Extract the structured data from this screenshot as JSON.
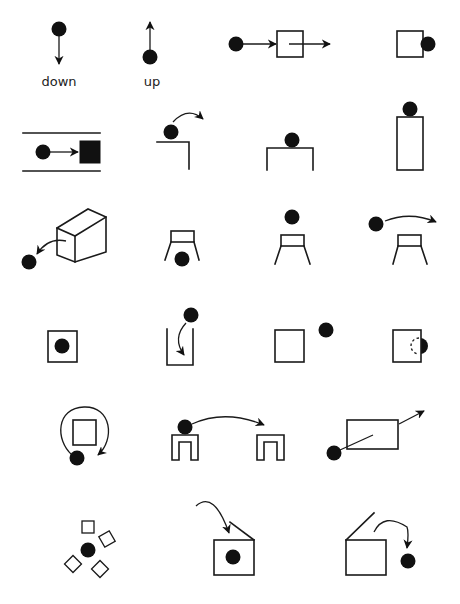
{
  "colors": {
    "ink": "#111111",
    "background": "#ffffff"
  },
  "labels": {
    "down": "down",
    "up": "up"
  },
  "panels": [
    {
      "id": "down",
      "label": "down",
      "desc": "ball with arrow pointing down"
    },
    {
      "id": "up",
      "label": "up",
      "desc": "ball with arrow pointing up"
    },
    {
      "id": "through",
      "desc": "ball moving through a box"
    },
    {
      "id": "contact-side",
      "desc": "ball touching side of box"
    },
    {
      "id": "blocked",
      "desc": "ball moving in channel toward solid block"
    },
    {
      "id": "over-edge",
      "desc": "ball rolling off a ledge"
    },
    {
      "id": "on-top-table",
      "desc": "ball resting on a table"
    },
    {
      "id": "on-top-tall",
      "desc": "ball on top of tall box"
    },
    {
      "id": "out-of-box",
      "desc": "ball coming out of 3D box"
    },
    {
      "id": "under-stool",
      "desc": "ball under a stool"
    },
    {
      "id": "above-stool",
      "desc": "ball above a stool"
    },
    {
      "id": "pass-over-stool",
      "desc": "ball passing over a stool"
    },
    {
      "id": "inside-box",
      "desc": "ball inside a box"
    },
    {
      "id": "into-container",
      "desc": "ball falling into container"
    },
    {
      "id": "near-box",
      "desc": "ball near a box"
    },
    {
      "id": "behind-box",
      "desc": "ball partially behind a box"
    },
    {
      "id": "around-box",
      "desc": "ball circling around a box"
    },
    {
      "id": "move-between-tables",
      "desc": "ball moving from one table to another"
    },
    {
      "id": "pierce",
      "desc": "ball piercing through rectangle"
    },
    {
      "id": "surrounded",
      "desc": "ball surrounded by squares"
    },
    {
      "id": "into-lidded-box",
      "desc": "ball going into box with open lid"
    },
    {
      "id": "out-of-lidded-box",
      "desc": "ball coming out of box with open lid"
    }
  ]
}
